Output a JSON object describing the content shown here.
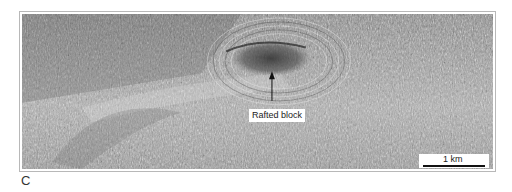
{
  "figure": {
    "panel_label": "C",
    "annotations": [
      {
        "text": "Rafted block",
        "type": "arrow-label"
      }
    ],
    "scale_bar": {
      "label": "1 km"
    },
    "colors": {
      "background": "#ffffff",
      "frame": "#b8b8b8",
      "image_mid": "#8a8a8a"
    }
  }
}
